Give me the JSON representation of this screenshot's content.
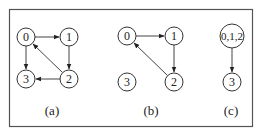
{
  "figure": {
    "panels": [
      {
        "caption": "(a)",
        "nodes": [
          {
            "id": "0",
            "label": "0",
            "x": 26,
            "y": 37,
            "r": 9
          },
          {
            "id": "1",
            "label": "1",
            "x": 69,
            "y": 37,
            "r": 9
          },
          {
            "id": "2",
            "label": "2",
            "x": 69,
            "y": 79,
            "r": 9
          },
          {
            "id": "3",
            "label": "3",
            "x": 26,
            "y": 79,
            "r": 9
          }
        ],
        "edges": [
          {
            "from": "0",
            "to": "1"
          },
          {
            "from": "1",
            "to": "2"
          },
          {
            "from": "2",
            "to": "0"
          },
          {
            "from": "2",
            "to": "3"
          },
          {
            "from": "0",
            "to": "3"
          }
        ]
      },
      {
        "caption": "(b)",
        "nodes": [
          {
            "id": "0",
            "label": "0",
            "x": 127,
            "y": 36,
            "r": 9
          },
          {
            "id": "1",
            "label": "1",
            "x": 174,
            "y": 36,
            "r": 9
          },
          {
            "id": "2",
            "label": "2",
            "x": 174,
            "y": 82,
            "r": 9
          },
          {
            "id": "3",
            "label": "3",
            "x": 127,
            "y": 82,
            "r": 9
          }
        ],
        "edges": [
          {
            "from": "0",
            "to": "1"
          },
          {
            "from": "1",
            "to": "2"
          },
          {
            "from": "2",
            "to": "0"
          }
        ]
      },
      {
        "caption": "(c)",
        "nodes": [
          {
            "id": "012",
            "label": "0,1,2",
            "x": 232,
            "y": 36,
            "r": 12
          },
          {
            "id": "3",
            "label": "3",
            "x": 232,
            "y": 82,
            "r": 9
          }
        ],
        "edges": [
          {
            "from": "012",
            "to": "3"
          }
        ]
      }
    ]
  },
  "captions": {
    "a": "(a)",
    "b": "(b)",
    "c": "(c)"
  },
  "labels": {
    "a0": "0",
    "a1": "1",
    "a2": "2",
    "a3": "3",
    "b0": "0",
    "b1": "1",
    "b2": "2",
    "b3": "3",
    "c012": "0,1,2",
    "c3": "3"
  }
}
